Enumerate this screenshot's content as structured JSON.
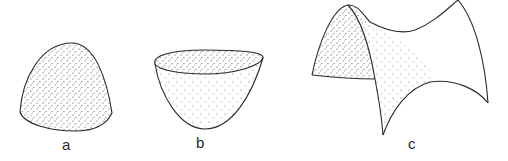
{
  "figure": {
    "panels": [
      {
        "id": "a",
        "label": "a",
        "shape": "dome-surface (positive curvature, convex cap)"
      },
      {
        "id": "b",
        "label": "b",
        "shape": "bowl-surface (positive curvature, concave paraboloid)"
      },
      {
        "id": "c",
        "label": "c",
        "shape": "saddle-surface (negative curvature, hyperbolic paraboloid)"
      }
    ],
    "colors": {
      "stroke": "#2a2a2a",
      "stipple": "#3a3a3a",
      "background": "#ffffff"
    }
  }
}
